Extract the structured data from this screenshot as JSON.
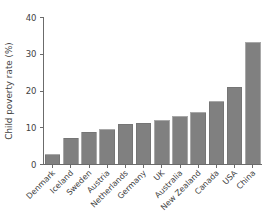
{
  "chart_data": {
    "type": "bar",
    "title": "",
    "subtitle": "",
    "xlabel": "",
    "ylabel": "Child poverty rate (%)",
    "categories": [
      "Denmark",
      "Iceland",
      "Sweden",
      "Austria",
      "Netherlands",
      "Germany",
      "UK",
      "Australia",
      "New Zealand",
      "Canada",
      "USA",
      "China"
    ],
    "values": [
      2.7,
      7.1,
      8.8,
      9.5,
      10.9,
      11.2,
      11.9,
      13.0,
      14.1,
      17.1,
      21.0,
      33.1
    ],
    "ylim": [
      0,
      40
    ],
    "yticks": [
      0,
      10,
      20,
      30,
      40
    ],
    "ytick_labels": [
      "0",
      "10",
      "20",
      "30",
      "40"
    ],
    "grid": false,
    "legend": false,
    "legend_position": "none",
    "bar_color": "#808080",
    "bar_edge_color": "#6e6e6e",
    "axis_color": "#6b6b6b",
    "background_color": "#ffffff",
    "category_label_rotation": -45
  }
}
